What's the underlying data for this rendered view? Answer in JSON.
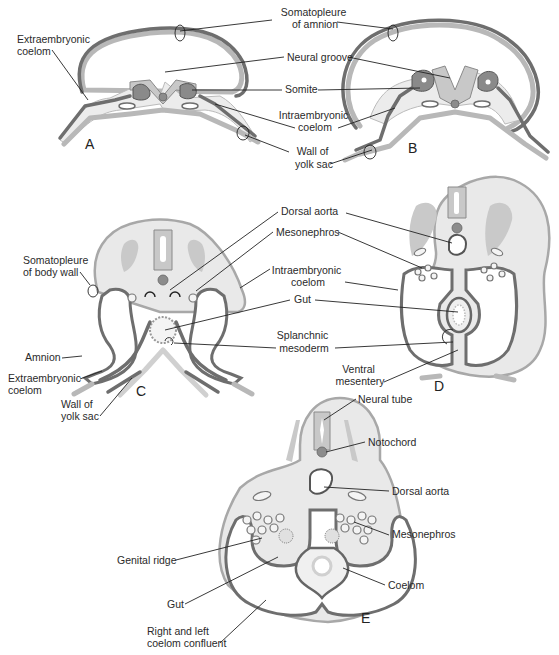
{
  "figure": {
    "panels": [
      "A",
      "B",
      "C",
      "D",
      "E"
    ],
    "labels": {
      "somatopleure_amnion": [
        "Somatopleure",
        "of amnion"
      ],
      "extraembryonic_coelom_a": [
        "Extraembryonic",
        "coelom"
      ],
      "neural_groove": "Neural groove",
      "somite": "Somite",
      "intraembryonic_coelom_ab": [
        "Intraembryonic",
        "coelom"
      ],
      "wall_yolk_sac_ab": [
        "Wall of",
        "yolk sac"
      ],
      "dorsal_aorta_cd": "Dorsal aorta",
      "mesonephros_cd": "Mesonephros",
      "somatopleure_body_wall": [
        "Somatopleure",
        "of body wall"
      ],
      "intraembryonic_coelom_cd": [
        "Intraembryonic",
        "coelom"
      ],
      "gut_cd": "Gut",
      "splanchnic_mesoderm": [
        "Splanchnic",
        "mesoderm"
      ],
      "amnion": "Amnion",
      "extraembryonic_coelom_c": [
        "Extraembryonic",
        "coelom"
      ],
      "wall_yolk_sac_c": [
        "Wall of",
        "yolk sac"
      ],
      "ventral_mesentery": [
        "Ventral",
        "mesentery"
      ],
      "neural_tube": "Neural tube",
      "notochord": "Notochord",
      "dorsal_aorta_e": "Dorsal aorta",
      "mesonephros_e": "Mesonephros",
      "genital_ridge": "Genital ridge",
      "coelom": "Coelom",
      "gut_e": "Gut",
      "coelom_confluent": [
        "Right and left",
        "coelom confluent"
      ]
    },
    "colors": {
      "ectoderm": "#b8b8b8",
      "mesoderm": "#6e6e6e",
      "body_fill": "#e9e9e9",
      "neural_tissue": "#c8c8c8",
      "notochord": "#8c8c8c",
      "leader_line": "#222222"
    }
  }
}
